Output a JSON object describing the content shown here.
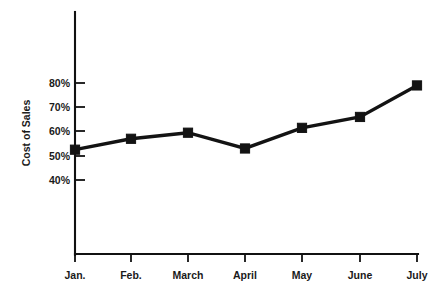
{
  "chart_data": {
    "type": "line",
    "title": "",
    "subtitle": "",
    "xlabel": "",
    "ylabel": "Cost of Sales",
    "categories": [
      "Jan.",
      "Feb.",
      "March",
      "April",
      "May",
      "June",
      "July"
    ],
    "values": [
      52.5,
      57,
      59.5,
      53,
      61.5,
      66,
      79
    ],
    "y_tick_labels": [
      "80%",
      "70%",
      "60%",
      "50%",
      "40%"
    ],
    "y_tick_values": [
      80,
      70,
      60,
      50,
      40
    ],
    "ylim": [
      40,
      80
    ],
    "grid": false,
    "legend": null,
    "legend_position": "none",
    "series_color": "#131313",
    "marker": "square",
    "axis_color": "#111111",
    "background_color": "#ffffff"
  },
  "axes": {
    "y_axis_title": "Cost of Sales",
    "x_axis_title": ""
  }
}
